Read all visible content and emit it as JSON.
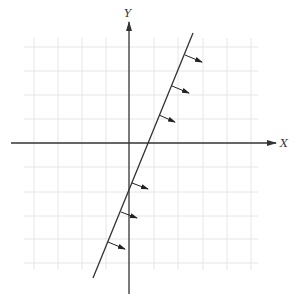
{
  "diagram": {
    "type": "half-plane inequality graph",
    "axes": {
      "x_label": "X",
      "y_label": "Y",
      "origin_px": [
        129,
        143
      ]
    },
    "grid": {
      "spacing_px": 24,
      "x_lines_px": [
        34,
        58,
        82,
        106,
        154,
        178,
        203,
        227,
        251
      ],
      "y_lines_px": [
        47,
        71,
        95,
        119,
        167,
        192,
        216,
        239,
        263
      ],
      "color": "#e6e6e6"
    },
    "boundary_line": {
      "from_px": [
        93,
        278
      ],
      "to_px": [
        193,
        33
      ],
      "color": "#333333"
    },
    "shading_arrows": [
      {
        "from": [
          185,
          55
        ],
        "to": [
          202,
          62
        ]
      },
      {
        "from": [
          172,
          86
        ],
        "to": [
          189,
          93
        ]
      },
      {
        "from": [
          159,
          115
        ],
        "to": [
          175,
          122
        ]
      },
      {
        "from": [
          132,
          183
        ],
        "to": [
          148,
          189
        ]
      },
      {
        "from": [
          121,
          212
        ],
        "to": [
          137,
          218
        ]
      },
      {
        "from": [
          108,
          242
        ],
        "to": [
          125,
          249
        ]
      }
    ],
    "shading_direction": "right of line"
  }
}
